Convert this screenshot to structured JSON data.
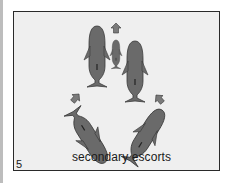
{
  "figure": {
    "panel_number": "5",
    "caption": "secondary escorts",
    "colors": {
      "whale_fill": "#6a6a6a",
      "whale_outline": "#3a3a3a",
      "arrow_fill": "#7a7a7a",
      "panel_bg": "#efefef",
      "border": "#2a2a2a"
    },
    "elements": [
      {
        "name": "adult-whale-left",
        "type": "whale"
      },
      {
        "name": "calf-whale",
        "type": "whale"
      },
      {
        "name": "adult-whale-right",
        "type": "whale"
      },
      {
        "name": "escort-whale-bottom-left",
        "type": "whale"
      },
      {
        "name": "escort-whale-bottom-right",
        "type": "whale"
      },
      {
        "name": "arrow-up",
        "type": "arrow"
      },
      {
        "name": "arrow-up-right",
        "type": "arrow"
      },
      {
        "name": "arrow-up-left",
        "type": "arrow"
      }
    ]
  }
}
